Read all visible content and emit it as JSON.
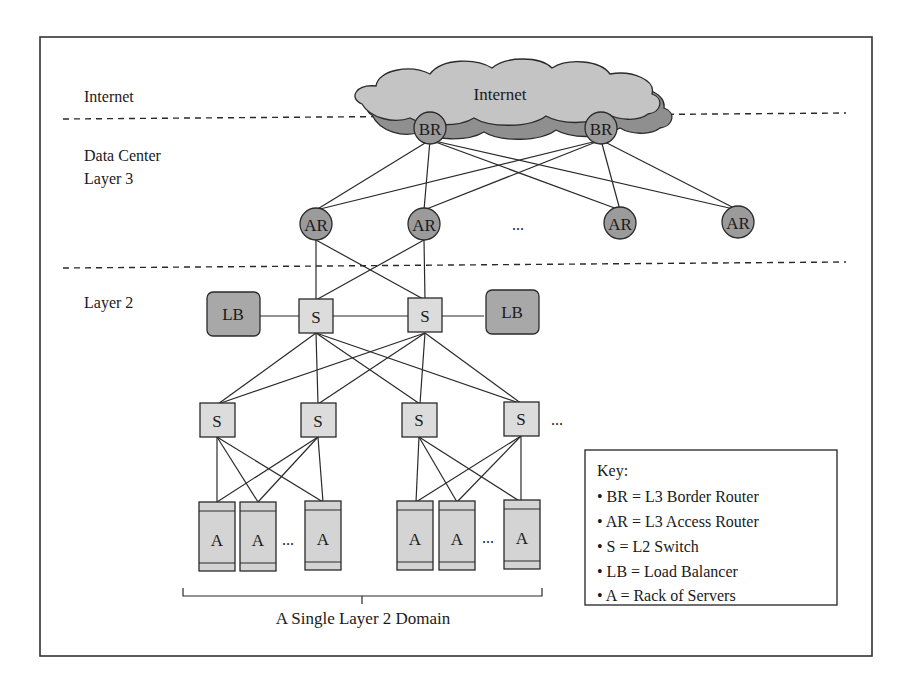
{
  "layers": {
    "internet": "Internet",
    "dc_layer3_line1": "Data Center",
    "dc_layer3_line2": "Layer 3",
    "layer2": "Layer 2"
  },
  "cloud": {
    "label": "Internet"
  },
  "nodes": {
    "border_routers": [
      {
        "id": "br1",
        "label": "BR"
      },
      {
        "id": "br2",
        "label": "BR"
      }
    ],
    "access_routers": [
      {
        "id": "ar1",
        "label": "AR"
      },
      {
        "id": "ar2",
        "label": "AR"
      },
      {
        "id": "ar3",
        "label": "AR"
      },
      {
        "id": "ar4",
        "label": "AR"
      }
    ],
    "access_router_ellipsis": "...",
    "aggregation_switches": [
      {
        "id": "s1",
        "label": "S"
      },
      {
        "id": "s2",
        "label": "S"
      }
    ],
    "load_balancers": [
      {
        "id": "lb1",
        "label": "LB"
      },
      {
        "id": "lb2",
        "label": "LB"
      }
    ],
    "tor_switches": [
      {
        "id": "s3",
        "label": "S"
      },
      {
        "id": "s4",
        "label": "S"
      },
      {
        "id": "s5",
        "label": "S"
      },
      {
        "id": "s6",
        "label": "S"
      }
    ],
    "tor_switch_ellipsis": "...",
    "racks_group_1": [
      {
        "id": "a1",
        "label": "A"
      },
      {
        "id": "a2",
        "label": "A"
      },
      {
        "id": "a3",
        "label": "A"
      }
    ],
    "racks_group_2": [
      {
        "id": "a4",
        "label": "A"
      },
      {
        "id": "a5",
        "label": "A"
      },
      {
        "id": "a6",
        "label": "A"
      }
    ],
    "rack_ellipsis": "..."
  },
  "domain_caption": "A Single Layer 2 Domain",
  "key": {
    "title": "Key:",
    "items": [
      "BR = L3 Border Router",
      "AR = L3 Access Router",
      "S = L2 Switch",
      "LB = Load Balancer",
      "A = Rack of Servers"
    ]
  },
  "colors": {
    "router_fill": "#9b9b9b",
    "switch_fill": "#dcdcdc",
    "load_balancer_fill": "#a8a8a8",
    "rack_fill": "#d4d4d4",
    "cloud_fill": "#c4c4c4",
    "cloud_shadow": "#8f8f8f",
    "line": "#2a2a2a"
  }
}
